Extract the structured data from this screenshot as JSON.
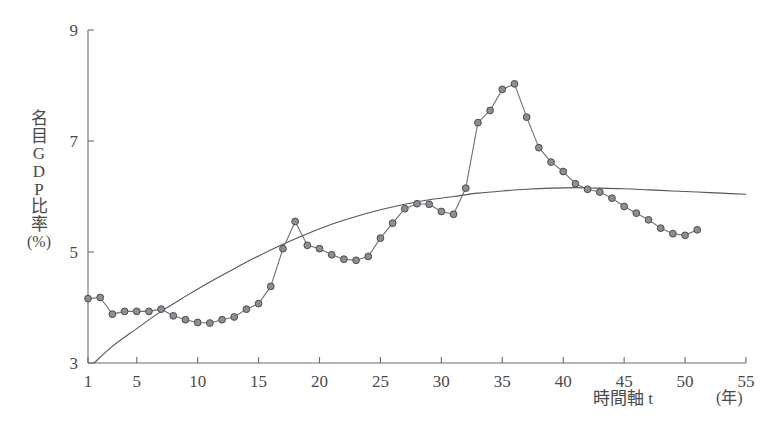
{
  "chart_data": {
    "type": "line",
    "title": "",
    "subtitle": "",
    "xlabel": "時間軸 t",
    "xunit": "(年)",
    "ylabel": "名目GDP比率 (%)",
    "ylabel_glyphs": [
      "名",
      "目",
      "G",
      "D",
      "P",
      "比",
      "率"
    ],
    "ylabel_unit": "(%)",
    "xlim": [
      1,
      55
    ],
    "ylim": [
      3,
      9
    ],
    "xticks": [
      1,
      5,
      10,
      15,
      20,
      25,
      30,
      35,
      40,
      45,
      50,
      55
    ],
    "xtick_labels": [
      "1",
      "5",
      "10",
      "15",
      "20",
      "25",
      "30",
      "35",
      "40",
      "45",
      "50",
      "55"
    ],
    "yticks": [
      3,
      5,
      7,
      9
    ],
    "ytick_labels": [
      "3",
      "5",
      "7",
      "9"
    ],
    "grid": false,
    "legend": false,
    "legend_position": "none",
    "marker_color": "#8d8d93",
    "marker_edge_color": "#4c4c52",
    "line_color": "#6f6f76",
    "trend_color": "#55555c",
    "axis_color": "#6b6b6b",
    "background": "#ffffff",
    "series": [
      {
        "name": "名目GDP比率 実績",
        "marker": "circle",
        "x": [
          1,
          2,
          3,
          4,
          5,
          6,
          7,
          8,
          9,
          10,
          11,
          12,
          13,
          14,
          15,
          16,
          17,
          18,
          19,
          20,
          21,
          22,
          23,
          24,
          25,
          26,
          27,
          28,
          29,
          30,
          31,
          32,
          33,
          34,
          35,
          36,
          37,
          38,
          39,
          40,
          41,
          42,
          43,
          44,
          45,
          46,
          47,
          48,
          49,
          50,
          51
        ],
        "values": [
          4.16,
          4.18,
          3.88,
          3.93,
          3.93,
          3.93,
          3.97,
          3.85,
          3.78,
          3.73,
          3.72,
          3.78,
          3.83,
          3.97,
          4.07,
          4.38,
          5.06,
          5.55,
          5.12,
          5.06,
          4.95,
          4.87,
          4.85,
          4.92,
          5.25,
          5.52,
          5.78,
          5.87,
          5.86,
          5.73,
          5.68,
          6.15,
          7.33,
          7.55,
          7.93,
          8.03,
          7.43,
          6.88,
          6.62,
          6.45,
          6.23,
          6.13,
          6.08,
          5.97,
          5.82,
          5.7,
          5.58,
          5.43,
          5.33,
          5.3,
          5.4
        ]
      },
      {
        "name": "トレンド曲線",
        "marker": "none",
        "x": [
          1.5,
          3,
          5,
          7,
          9,
          11,
          13,
          15,
          17,
          19,
          21,
          23,
          25,
          27,
          29,
          31,
          33,
          35,
          37,
          39,
          41,
          43,
          45,
          47,
          49,
          51,
          53,
          55
        ],
        "values": [
          3.0,
          3.3,
          3.62,
          3.93,
          4.2,
          4.46,
          4.7,
          4.93,
          5.14,
          5.33,
          5.5,
          5.64,
          5.76,
          5.86,
          5.94,
          6.0,
          6.06,
          6.1,
          6.13,
          6.15,
          6.16,
          6.15,
          6.14,
          6.12,
          6.1,
          6.08,
          6.06,
          6.04
        ]
      }
    ]
  }
}
